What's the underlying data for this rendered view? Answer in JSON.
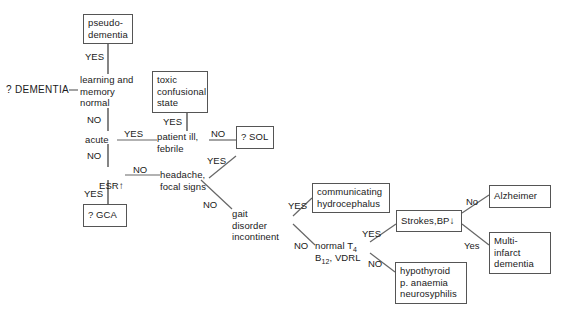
{
  "diagram": {
    "root_label": "? DEMENTIA",
    "stroke_color": "#555555",
    "text_color": "#1a1a1a",
    "background": "#ffffff"
  },
  "nodes": {
    "pseudo_dementia": "pseudo-\ndementia",
    "learning_memory": "learning and\nmemory\nnormal",
    "toxic_state": "toxic\nconfusional\nstate",
    "acute": "acute",
    "patient_ill": "patient ill,\nfebrile",
    "sol": "? SOL",
    "esr": "ESR",
    "esr_arrow": "↑",
    "headache": "headache,\nfocal signs",
    "gca": "? GCA",
    "gait": "gait\ndisorder\nincontinent",
    "hydrocephalus": "communicating\nhydrocephalus",
    "normal_labs_line1": "normal T",
    "normal_labs_sub1": "4",
    "normal_labs_line2a": "B",
    "normal_labs_sub2": "12",
    "normal_labs_line2b": ", VDRL",
    "strokes": "Strokes,BP",
    "strokes_arrow": "↓",
    "hypothyroid": "hypothyroid\np. anaemia\nneurosyphilis",
    "alzheimer": "Alzheimer",
    "multi_infarct": "Multi-\ninfarct\ndementia"
  },
  "edge_labels": {
    "yes_pseudo": "YES",
    "no_learning": "NO",
    "yes_acute": "YES",
    "yes_toxic": "YES",
    "no_patient_ill": "NO",
    "no_acute": "NO",
    "yes_sol": "YES",
    "no_esr": "NO",
    "yes_esr": "YES",
    "no_headache": "NO",
    "yes_gait": "YES",
    "no_gait": "NO",
    "yes_labs": "YES",
    "no_labs": "NO",
    "no_strokes": "No",
    "yes_strokes": "Yes"
  }
}
